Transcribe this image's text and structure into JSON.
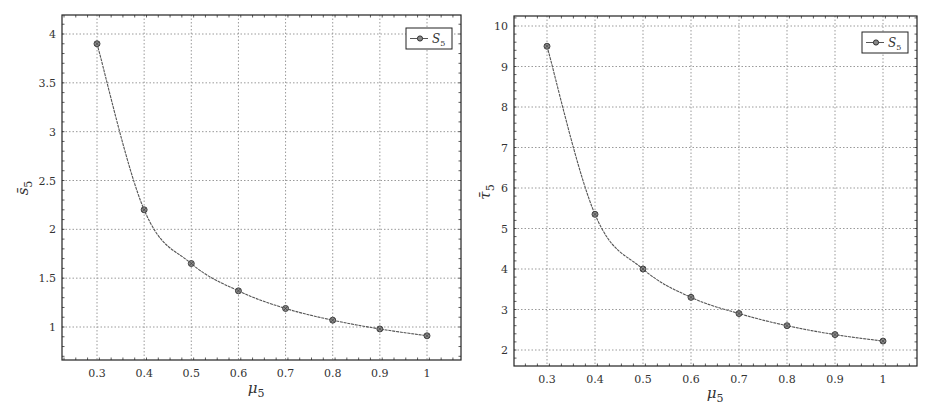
{
  "chart_data": [
    {
      "type": "line",
      "title": "",
      "xlabel": "μ5",
      "ylabel": "s̄5",
      "x": [
        0.3,
        0.4,
        0.5,
        0.6,
        0.7,
        0.8,
        0.9,
        1.0
      ],
      "series": [
        {
          "name": "S5",
          "values": [
            3.9,
            2.2,
            1.65,
            1.37,
            1.19,
            1.07,
            0.98,
            0.91
          ]
        }
      ],
      "xticks": [
        "0.3",
        "0.4",
        "0.5",
        "0.6",
        "0.7",
        "0.8",
        "0.9",
        "1"
      ],
      "yticks": [
        "1",
        "1.5",
        "2",
        "2.5",
        "3",
        "3.5",
        "4"
      ],
      "xlim": [
        0.23,
        1.07
      ],
      "ylim": [
        0.68,
        4.2
      ],
      "grid": true,
      "legend_position": "upper right",
      "legend_entries": [
        "S5"
      ]
    },
    {
      "type": "line",
      "title": "",
      "xlabel": "μ5",
      "ylabel": "τ̄5",
      "x": [
        0.3,
        0.4,
        0.5,
        0.6,
        0.7,
        0.8,
        0.9,
        1.0
      ],
      "series": [
        {
          "name": "S5",
          "values": [
            9.5,
            5.35,
            4.0,
            3.3,
            2.9,
            2.6,
            2.38,
            2.22
          ]
        }
      ],
      "xticks": [
        "0.3",
        "0.4",
        "0.5",
        "0.6",
        "0.7",
        "0.8",
        "0.9",
        "1"
      ],
      "yticks": [
        "2",
        "3",
        "4",
        "5",
        "6",
        "7",
        "8",
        "9",
        "10"
      ],
      "xlim": [
        0.23,
        1.07
      ],
      "ylim": [
        1.6,
        10.25
      ],
      "grid": true,
      "legend_position": "upper right",
      "legend_entries": [
        "S5"
      ]
    }
  ],
  "charts": {
    "left": {
      "xlabel_main": "μ",
      "xlabel_sub": "5",
      "ylabel_main": "s̄",
      "ylabel_sub": "5",
      "legend_main": "S",
      "legend_sub": "5"
    },
    "right": {
      "xlabel_main": "μ",
      "xlabel_sub": "5",
      "ylabel_main": "τ̄",
      "ylabel_sub": "5",
      "legend_main": "S",
      "legend_sub": "5"
    }
  },
  "colors": {
    "line": "#555555",
    "marker": "#444444",
    "grid": "#9a9a9a",
    "frame": "#222222"
  }
}
